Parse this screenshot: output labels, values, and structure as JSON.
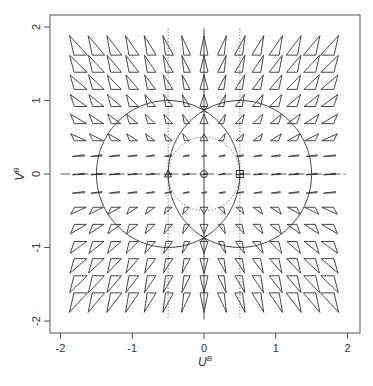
{
  "chart_data": {
    "type": "vector-field",
    "title": "",
    "xlabel": "U^B",
    "ylabel": "V^B",
    "xlim": [
      -2.15,
      2.15
    ],
    "ylim": [
      -2.15,
      2.15
    ],
    "xticks": [
      -2,
      -1,
      0,
      1,
      2
    ],
    "yticks": [
      -2,
      -1,
      0,
      1,
      2
    ],
    "grid": false,
    "legend": null,
    "field": {
      "grid_x": [
        -1.75,
        -1.5,
        -1.25,
        -1.0,
        -0.75,
        -0.5,
        -0.25,
        0,
        0.25,
        0.5,
        0.75,
        1.0,
        1.25,
        1.5,
        1.75
      ],
      "grid_y": [
        1.75,
        1.5,
        1.25,
        1.0,
        0.75,
        0.5,
        0.25,
        0,
        -0.25,
        -0.5,
        -0.75,
        -1.0,
        -1.25,
        -1.5,
        -1.75
      ],
      "glyph": "triangle",
      "description": "Triangle glyphs whose shape encodes a 2D tensor/vector at each grid point; thin dashes near V=0, tall triangles near U=0, elongated diagonal triangles toward corners"
    },
    "overlays": [
      {
        "type": "circle",
        "center": [
          -0.5,
          0
        ],
        "radius": 1.0,
        "style": "solid"
      },
      {
        "type": "circle",
        "center": [
          0.5,
          0
        ],
        "radius": 1.0,
        "style": "solid"
      },
      {
        "type": "circle",
        "center": [
          0,
          0
        ],
        "radius": 0.5,
        "style": "dotted"
      },
      {
        "type": "vline",
        "x": -0.5,
        "style": "dotted"
      },
      {
        "type": "vline",
        "x": 0.5,
        "style": "dotted"
      },
      {
        "type": "vline",
        "x": 0,
        "style": "solid"
      },
      {
        "type": "hline",
        "y": 0,
        "style": "dashdot"
      }
    ],
    "markers": [
      {
        "shape": "circle",
        "x": 0,
        "y": 0
      },
      {
        "shape": "square",
        "x": 0.5,
        "y": 0
      },
      {
        "shape": "triangle",
        "x": -0.5,
        "y": 0
      },
      {
        "shape": "x",
        "x": 0,
        "y": 0.87
      },
      {
        "shape": "x",
        "x": 0,
        "y": -0.87
      }
    ]
  },
  "axes": {
    "x_tick_labels": [
      "-2",
      "-1",
      "0",
      "1",
      "2"
    ],
    "y_tick_labels": [
      "-2",
      "-1",
      "0",
      "1",
      "2"
    ],
    "x_title_main": "U",
    "x_title_sup": "B",
    "y_title_main": "V",
    "y_title_sup": "B"
  },
  "colors": {
    "ink": "#333333",
    "frame": "#555555",
    "background": "#ffffff"
  }
}
